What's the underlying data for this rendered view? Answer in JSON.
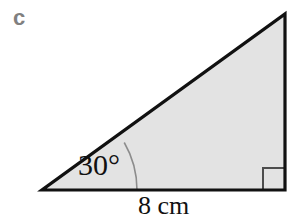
{
  "figure": {
    "part_label": "c",
    "angle_label": "30°",
    "base_label": "8 cm",
    "right_angle_marker": "right-angle-square",
    "shape": "right-triangle",
    "colors": {
      "background": "#ffffff",
      "fill": "#e3e3e3",
      "outline": "#111111",
      "part_label": "#808080",
      "arc": "#8c8c8c",
      "right_angle": "#4d4d4d"
    },
    "geometry": {
      "vertex_left": [
        42,
        190
      ],
      "vertex_bottom_right": [
        285,
        190
      ],
      "vertex_top_right": [
        285,
        14
      ],
      "arc_radius": 95,
      "right_angle_size": 22,
      "outline_width": 3
    }
  }
}
